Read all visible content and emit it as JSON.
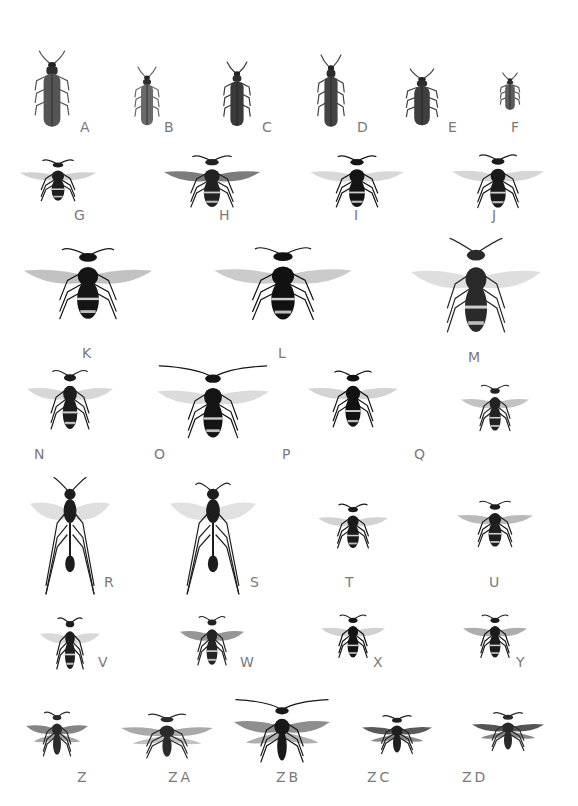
{
  "plate": {
    "background": "#ffffff",
    "label_color": "#7a7a7a",
    "specimens": [
      {
        "label": "A",
        "kind": "beetle",
        "cx": 52,
        "cy": 90,
        "w": 28,
        "h": 78,
        "lx": 80,
        "ly": 120,
        "tone": "#555555"
      },
      {
        "label": "B",
        "kind": "beetle",
        "cx": 147,
        "cy": 97,
        "w": 20,
        "h": 60,
        "lx": 164,
        "ly": 120,
        "tone": "#6a6a6a"
      },
      {
        "label": "C",
        "kind": "beetle",
        "cx": 237,
        "cy": 95,
        "w": 22,
        "h": 66,
        "lx": 262,
        "ly": 120,
        "tone": "#3a3a3a"
      },
      {
        "label": "D",
        "kind": "beetle",
        "cx": 331,
        "cy": 92,
        "w": 22,
        "h": 74,
        "lx": 357,
        "ly": 120,
        "tone": "#444444"
      },
      {
        "label": "E",
        "kind": "beetle",
        "cx": 422,
        "cy": 98,
        "w": 26,
        "h": 58,
        "lx": 448,
        "ly": 120,
        "tone": "#3f3f3f"
      },
      {
        "label": "F",
        "kind": "beetle",
        "cx": 510,
        "cy": 92,
        "w": 16,
        "h": 38,
        "lx": 511,
        "ly": 120,
        "tone": "#5c5c5c"
      },
      {
        "label": "G",
        "kind": "wasp",
        "cx": 58,
        "cy": 184,
        "w": 76,
        "h": 56,
        "lx": 74,
        "ly": 208,
        "tone": "#1e1e1e",
        "wing": "#bdbdbd"
      },
      {
        "label": "H",
        "kind": "wasp",
        "cx": 212,
        "cy": 186,
        "w": 96,
        "h": 70,
        "lx": 219,
        "ly": 208,
        "tone": "#222222",
        "wing": "#444444"
      },
      {
        "label": "I",
        "kind": "wasp",
        "cx": 357,
        "cy": 186,
        "w": 94,
        "h": 70,
        "lx": 354,
        "ly": 208,
        "tone": "#141414",
        "wing": "#c8c8c8"
      },
      {
        "label": "J",
        "kind": "wasp",
        "cx": 498,
        "cy": 186,
        "w": 92,
        "h": 72,
        "lx": 492,
        "ly": 208,
        "tone": "#1a1a1a",
        "wing": "#c4c4c4"
      },
      {
        "label": "K",
        "kind": "wasp",
        "cx": 88,
        "cy": 290,
        "w": 128,
        "h": 96,
        "lx": 82,
        "ly": 346,
        "tone": "#151515",
        "wing": "#a8a8a8"
      },
      {
        "label": "L",
        "kind": "wasp",
        "cx": 283,
        "cy": 290,
        "w": 138,
        "h": 98,
        "lx": 278,
        "ly": 346,
        "tone": "#111111",
        "wing": "#b5b5b5"
      },
      {
        "label": "M",
        "kind": "wasp",
        "cx": 476,
        "cy": 296,
        "w": 130,
        "h": 120,
        "lx": 468,
        "ly": 350,
        "tone": "#2a2a2a",
        "wing": "#d0d0d0"
      },
      {
        "label": "N",
        "kind": "wasp",
        "cx": 70,
        "cy": 405,
        "w": 86,
        "h": 80,
        "lx": 34,
        "ly": 447,
        "tone": "#1c1c1c",
        "wing": "#c6c6c6"
      },
      {
        "label": "O",
        "kind": "wasp",
        "cx": 213,
        "cy": 410,
        "w": 112,
        "h": 92,
        "lx": 154,
        "ly": 447,
        "tone": "#141414",
        "wing": "#cccccc"
      },
      {
        "label": "P",
        "kind": "wasp",
        "cx": 353,
        "cy": 404,
        "w": 90,
        "h": 76,
        "lx": 282,
        "ly": 447,
        "tone": "#121212",
        "wing": "#c0c0c0"
      },
      {
        "label": "Q",
        "kind": "wasp",
        "cx": 495,
        "cy": 412,
        "w": 68,
        "h": 62,
        "lx": 414,
        "ly": 447,
        "tone": "#232323",
        "wing": "#a9a9a9"
      },
      {
        "label": "R",
        "kind": "ichneumon",
        "cx": 70,
        "cy": 535,
        "w": 80,
        "h": 120,
        "lx": 104,
        "ly": 575,
        "tone": "#1d1d1d",
        "wing": "#d2d2d2"
      },
      {
        "label": "S",
        "kind": "ichneumon",
        "cx": 213,
        "cy": 535,
        "w": 86,
        "h": 120,
        "lx": 250,
        "ly": 575,
        "tone": "#1d1d1d",
        "wing": "#d4d4d4"
      },
      {
        "label": "T",
        "kind": "wasp",
        "cx": 353,
        "cy": 530,
        "w": 70,
        "h": 60,
        "lx": 345,
        "ly": 575,
        "tone": "#1a1a1a",
        "wing": "#c0c0c0"
      },
      {
        "label": "U",
        "kind": "wasp",
        "cx": 495,
        "cy": 528,
        "w": 76,
        "h": 62,
        "lx": 489,
        "ly": 575,
        "tone": "#1e1e1e",
        "wing": "#9c9c9c"
      },
      {
        "label": "V",
        "kind": "wasp",
        "cx": 70,
        "cy": 648,
        "w": 60,
        "h": 70,
        "lx": 98,
        "ly": 655,
        "tone": "#1e1e1e",
        "wing": "#c9c9c9"
      },
      {
        "label": "W",
        "kind": "wasp",
        "cx": 212,
        "cy": 645,
        "w": 64,
        "h": 66,
        "lx": 240,
        "ly": 655,
        "tone": "#232323",
        "wing": "#6a6a6a"
      },
      {
        "label": "X",
        "kind": "wasp",
        "cx": 353,
        "cy": 640,
        "w": 64,
        "h": 58,
        "lx": 373,
        "ly": 655,
        "tone": "#141414",
        "wing": "#bdbdbd"
      },
      {
        "label": "Y",
        "kind": "wasp",
        "cx": 495,
        "cy": 640,
        "w": 64,
        "h": 58,
        "lx": 516,
        "ly": 655,
        "tone": "#1b1b1b",
        "wing": "#8c8c8c"
      },
      {
        "label": "Z",
        "kind": "moth",
        "cx": 57,
        "cy": 738,
        "w": 62,
        "h": 60,
        "lx": 77,
        "ly": 770,
        "tone": "#2b2b2b",
        "wing": "#6e6e6e"
      },
      {
        "label": "ZA",
        "kind": "moth",
        "cx": 167,
        "cy": 740,
        "w": 92,
        "h": 60,
        "lx": 168,
        "ly": 770,
        "tone": "#2b2b2b",
        "wing": "#9a9a9a"
      },
      {
        "label": "ZB",
        "kind": "moth",
        "cx": 282,
        "cy": 738,
        "w": 96,
        "h": 80,
        "lx": 276,
        "ly": 770,
        "tone": "#181818",
        "wing": "#7a7a7a"
      },
      {
        "label": "ZC",
        "kind": "moth",
        "cx": 397,
        "cy": 738,
        "w": 70,
        "h": 52,
        "lx": 367,
        "ly": 770,
        "tone": "#202020",
        "wing": "#3c3c3c"
      },
      {
        "label": "ZD",
        "kind": "moth",
        "cx": 508,
        "cy": 735,
        "w": 72,
        "h": 52,
        "lx": 462,
        "ly": 770,
        "tone": "#2a2a2a",
        "wing": "#363636"
      }
    ]
  }
}
